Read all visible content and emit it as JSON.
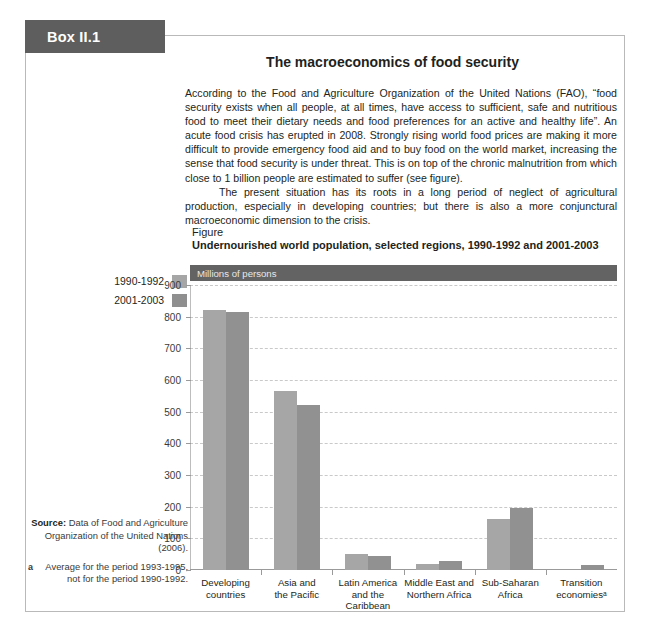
{
  "box": {
    "tab_label": "Box II.1",
    "title": "The macroeconomics of food security",
    "paragraphs": [
      "According to the Food and Agriculture Organization of the United Nations (FAO), “food security exists when all people, at all times, have access to sufficient, safe and nutritious food to meet their dietary needs and food preferences for an active and healthy life”. An acute food crisis has erupted in 2008. Strongly rising world food prices are making it more difficult to provide emergency food aid and to buy food on the world market, increasing the sense that food security is under threat. This is on top of the chronic malnutrition from which close to 1 billion people are estimated to suffer (see figure).",
      "The present situation has its roots in a long period of neglect of agricultural production, especially in developing countries; but there is also a more conjunctural macroeconomic dimension to the crisis."
    ]
  },
  "figure": {
    "label": "Figure",
    "title": "Undernourished world population, selected regions, 1990-1992 and 2001-2003",
    "unit_banner": "Millions of persons",
    "legend": [
      {
        "label": "1990-1992",
        "color": "#a6a6a6"
      },
      {
        "label": "2001-2003",
        "color": "#8f8f8f"
      }
    ]
  },
  "source": {
    "label": "Source:",
    "text": " Data of Food and Agriculture Organization of the United Nations (2006).",
    "footnote_marker": "a",
    "footnote_text": "Average for the period 1993-1995, not for the period 1990-1992."
  },
  "chart_data": {
    "type": "bar",
    "title": "Undernourished world population, selected regions, 1990-1992 and 2001-2003",
    "xlabel": "",
    "ylabel": "Millions of persons",
    "ylim": [
      0,
      900
    ],
    "yticks": [
      0,
      100,
      200,
      300,
      400,
      500,
      600,
      700,
      800,
      900
    ],
    "grid": true,
    "legend_position": "left-outside",
    "categories": [
      "Developing\ncountries",
      "Asia and\nthe Pacific",
      "Latin America\nand the Caribbean",
      "Middle East and\nNorthern Africa",
      "Sub-Saharan\nAfrica",
      "Transition\neconomiesᵃ"
    ],
    "series": [
      {
        "name": "1990-1992",
        "color": "#a6a6a6",
        "values": [
          820,
          565,
          52,
          20,
          162,
          0
        ]
      },
      {
        "name": "2001-2003",
        "color": "#919191",
        "values": [
          815,
          520,
          45,
          28,
          195,
          15
        ]
      }
    ]
  }
}
